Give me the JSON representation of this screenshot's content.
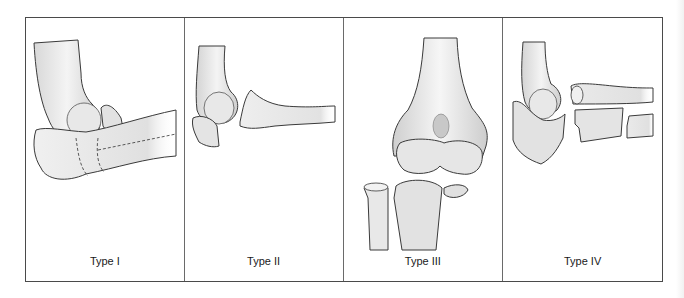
{
  "figure": {
    "panels": [
      {
        "label": "Type I",
        "illustration": "elbow-lateral-view-fragment-with-dashed-fracture-lines"
      },
      {
        "label": "Type II",
        "illustration": "elbow-lateral-view-displaced-fragment"
      },
      {
        "label": "Type III",
        "illustration": "elbow-anterior-view-comminuted"
      },
      {
        "label": "Type IV",
        "illustration": "elbow-lateral-view-fractured-forearm-shafts"
      }
    ],
    "colors": {
      "border": "#4a4a4a",
      "bone_fill": "#ececec",
      "bone_shade": "#c9c9c9",
      "outline": "#3a3a3a",
      "label": "#1a1a1a"
    }
  }
}
